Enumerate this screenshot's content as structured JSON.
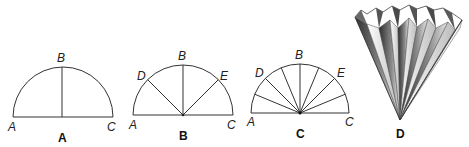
{
  "panels": [
    {
      "caption": "A",
      "points": {
        "A": "A",
        "B": "B",
        "C": "C"
      }
    },
    {
      "caption": "B",
      "points": {
        "A": "A",
        "B": "B",
        "C": "C",
        "D": "D",
        "E": "E"
      }
    },
    {
      "caption": "C",
      "points": {
        "A": "A",
        "B": "B",
        "C": "C",
        "D": "D",
        "E": "E"
      }
    },
    {
      "caption": "D"
    }
  ],
  "colors": {
    "line": "#333333",
    "fold_dark": "#3a3a3a",
    "fold_light": "#f2f2f2"
  }
}
